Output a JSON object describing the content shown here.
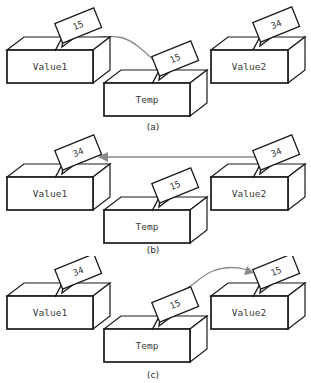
{
  "figure": {
    "colors": {
      "box_stroke": "#1a1a1a",
      "box_fill": "#ffffff",
      "tag_stroke": "#1a1a1a",
      "arrow": "#8a8a8a",
      "text": "#3a3a3a",
      "background": "#ffffff"
    },
    "panels": [
      {
        "id": "a",
        "caption": "(a)",
        "boxes": [
          {
            "name": "value1-box",
            "label": "Value1",
            "tag": "15"
          },
          {
            "name": "temp-box",
            "label": "Temp",
            "tag": "15"
          },
          {
            "name": "value2-box",
            "label": "Value2",
            "tag": "34"
          }
        ],
        "arrow": {
          "name": "copy-arrow-value1-to-temp",
          "from": "Value1",
          "to": "Temp",
          "shape": "curved",
          "direction": "right-down"
        }
      },
      {
        "id": "b",
        "caption": "(b)",
        "boxes": [
          {
            "name": "value1-box",
            "label": "Value1",
            "tag": "34"
          },
          {
            "name": "temp-box",
            "label": "Temp",
            "tag": "15"
          },
          {
            "name": "value2-box",
            "label": "Value2",
            "tag": "34"
          }
        ],
        "arrow": {
          "name": "copy-arrow-value2-to-value1",
          "from": "Value2",
          "to": "Value1",
          "shape": "straight",
          "direction": "left"
        }
      },
      {
        "id": "c",
        "caption": "(c)",
        "boxes": [
          {
            "name": "value1-box",
            "label": "Value1",
            "tag": "34"
          },
          {
            "name": "temp-box",
            "label": "Temp",
            "tag": "15"
          },
          {
            "name": "value2-box",
            "label": "Value2",
            "tag": "15"
          }
        ],
        "arrow": {
          "name": "copy-arrow-temp-to-value2",
          "from": "Temp",
          "to": "Value2",
          "shape": "curved",
          "direction": "right-up"
        }
      }
    ]
  }
}
